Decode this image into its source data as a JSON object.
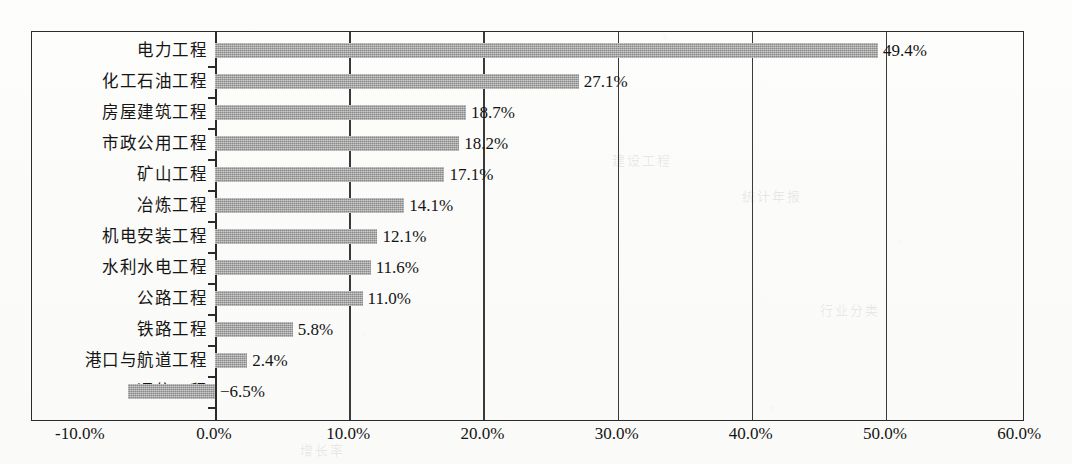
{
  "chart_data": {
    "type": "bar",
    "orientation": "horizontal",
    "title": "",
    "xlabel": "",
    "ylabel": "",
    "xlim": [
      -10,
      60
    ],
    "xtick_step": 10,
    "xtick_labels": [
      "-10.0%",
      "0.0%",
      "10.0%",
      "20.0%",
      "30.0%",
      "40.0%",
      "50.0%",
      "60.0%"
    ],
    "xtick_values": [
      -10,
      0,
      10,
      20,
      30,
      40,
      50,
      60
    ],
    "grid": "vertical-major",
    "legend": "none",
    "bar_color": "#9a9a9a",
    "axis_color": "#2b2b2b",
    "categories": [
      "电力工程",
      "化工石油工程",
      "房屋建筑工程",
      "市政公用工程",
      "矿山工程",
      "冶炼工程",
      "机电安装工程",
      "水利水电工程",
      "公路工程",
      "铁路工程",
      "港口与航道工程",
      "通信工程"
    ],
    "values": [
      49.4,
      27.1,
      18.7,
      18.2,
      17.1,
      14.1,
      12.1,
      11.6,
      11.0,
      5.8,
      2.4,
      -6.5
    ],
    "value_labels": [
      "49.4%",
      "27.1%",
      "18.7%",
      "18.2%",
      "17.1%",
      "14.1%",
      "12.1%",
      "11.6%",
      "11.0%",
      "5.8%",
      "2.4%",
      "−6.5%"
    ]
  },
  "ghost_marks": [
    {
      "text": "建设工程",
      "left": 612,
      "top": 150
    },
    {
      "text": "统计年报",
      "left": 742,
      "top": 186
    },
    {
      "text": "增长率",
      "left": 300,
      "top": 440
    },
    {
      "text": "行业分类",
      "left": 820,
      "top": 300
    }
  ]
}
